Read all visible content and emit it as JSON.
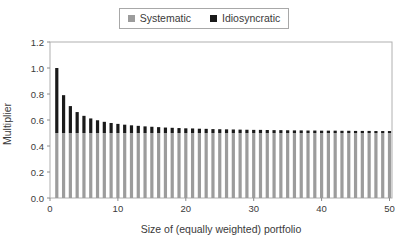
{
  "legend": {
    "items": [
      {
        "label": "Systematic",
        "color": "#9c9c9c"
      },
      {
        "label": "Idiosyncratic",
        "color": "#1a1a1a"
      }
    ]
  },
  "chart_data": {
    "type": "bar",
    "stacked": true,
    "title": "",
    "xlabel": "Size of (equally weighted) portfolio",
    "ylabel": "Multiplier",
    "ylim": [
      0,
      1.2
    ],
    "xlim": [
      0,
      50
    ],
    "grid": false,
    "legend_position": "top-center",
    "x_ticks": [
      0,
      10,
      20,
      30,
      40,
      50
    ],
    "x_tick_labels": [
      "0",
      "10",
      "20",
      "30",
      "40",
      "50"
    ],
    "y_ticks": [
      0,
      0.2,
      0.4,
      0.6,
      0.8,
      1.0,
      1.2
    ],
    "y_tick_labels": [
      "0.0",
      "0.2",
      "0.4",
      "0.6",
      "0.8",
      "1.0",
      "1.2"
    ],
    "x": [
      1,
      2,
      3,
      4,
      5,
      6,
      7,
      8,
      9,
      10,
      11,
      12,
      13,
      14,
      15,
      16,
      17,
      18,
      19,
      20,
      21,
      22,
      23,
      24,
      25,
      26,
      27,
      28,
      29,
      30,
      31,
      32,
      33,
      34,
      35,
      36,
      37,
      38,
      39,
      40,
      41,
      42,
      43,
      44,
      45,
      46,
      47,
      48,
      49,
      50
    ],
    "series": [
      {
        "name": "Systematic",
        "color": "#9c9c9c",
        "values": [
          0.5,
          0.5,
          0.5,
          0.5,
          0.5,
          0.5,
          0.5,
          0.5,
          0.5,
          0.5,
          0.5,
          0.5,
          0.5,
          0.5,
          0.5,
          0.5,
          0.5,
          0.5,
          0.5,
          0.5,
          0.5,
          0.5,
          0.5,
          0.5,
          0.5,
          0.5,
          0.5,
          0.5,
          0.5,
          0.5,
          0.5,
          0.5,
          0.5,
          0.5,
          0.5,
          0.5,
          0.5,
          0.5,
          0.5,
          0.5,
          0.5,
          0.5,
          0.5,
          0.5,
          0.5,
          0.5,
          0.5,
          0.5,
          0.5,
          0.5
        ]
      },
      {
        "name": "Idiosyncratic",
        "color": "#1a1a1a",
        "values": [
          0.5,
          0.291,
          0.207,
          0.161,
          0.132,
          0.112,
          0.098,
          0.086,
          0.077,
          0.07,
          0.064,
          0.059,
          0.055,
          0.051,
          0.048,
          0.045,
          0.042,
          0.04,
          0.038,
          0.036,
          0.035,
          0.033,
          0.032,
          0.03,
          0.029,
          0.028,
          0.027,
          0.026,
          0.025,
          0.024,
          0.024,
          0.023,
          0.022,
          0.022,
          0.021,
          0.02,
          0.02,
          0.019,
          0.019,
          0.018,
          0.018,
          0.018,
          0.017,
          0.017,
          0.016,
          0.016,
          0.016,
          0.015,
          0.015,
          0.015
        ]
      }
    ]
  }
}
